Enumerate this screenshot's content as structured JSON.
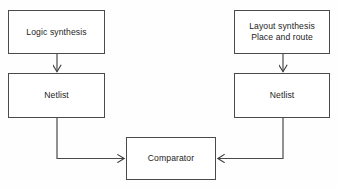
{
  "diagram": {
    "background_color": "#fefefe",
    "stroke_color": "#4a4a4a",
    "text_color": "#1c1c1c",
    "nodes": [
      {
        "id": "logic-synthesis",
        "label": "Logic synthesis",
        "x": 8,
        "y": 10,
        "w": 97,
        "h": 44
      },
      {
        "id": "layout-synthesis",
        "label": "Layout synthesis\nPlace and route",
        "x": 234,
        "y": 10,
        "w": 96,
        "h": 44
      },
      {
        "id": "netlist-left",
        "label": "Netlist",
        "x": 8,
        "y": 73,
        "w": 97,
        "h": 45
      },
      {
        "id": "netlist-right",
        "label": "Netlist",
        "x": 234,
        "y": 73,
        "w": 96,
        "h": 45
      },
      {
        "id": "comparator",
        "label": "Comparator",
        "x": 126,
        "y": 137,
        "w": 90,
        "h": 43
      }
    ],
    "edges": [
      {
        "id": "logic-to-netlist-left",
        "from": "logic-synthesis",
        "to": "netlist-left",
        "direction": "down",
        "arrowhead": true
      },
      {
        "id": "layout-to-netlist-right",
        "from": "layout-synthesis",
        "to": "netlist-right",
        "direction": "down",
        "arrowhead": true
      },
      {
        "id": "netlist-left-to-comparator",
        "from": "netlist-left",
        "to": "comparator",
        "direction": "down-then-right",
        "arrowhead": true
      },
      {
        "id": "netlist-right-to-comparator",
        "from": "netlist-right",
        "to": "comparator",
        "direction": "down-then-left",
        "arrowhead": true
      }
    ]
  }
}
